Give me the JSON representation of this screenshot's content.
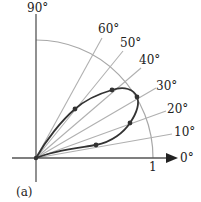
{
  "figure": {
    "panel_label": "(a)",
    "axis_labels": {
      "x_end": "0°",
      "y_end": "90°"
    },
    "unit_circle_label": "1",
    "rays": [
      {
        "angle": 10,
        "label": "10°"
      },
      {
        "angle": 20,
        "label": "20°"
      },
      {
        "angle": 30,
        "label": "30°"
      },
      {
        "angle": 40,
        "label": "40°"
      },
      {
        "angle": 50,
        "label": "50°"
      },
      {
        "angle": 60,
        "label": "60°"
      }
    ],
    "curve_points": [
      {
        "angle_deg": 12,
        "r": 0.52
      },
      {
        "angle_deg": 20,
        "r": 0.86
      },
      {
        "angle_deg": 31,
        "r": 1.0
      },
      {
        "angle_deg": 42,
        "r": 0.87
      },
      {
        "angle_deg": 51.5,
        "r": 0.54
      }
    ],
    "colors": {
      "axes": "#555555",
      "rays": "#aaaaaa",
      "arc": "#999999",
      "curve": "#333333",
      "dots": "#333333"
    }
  }
}
